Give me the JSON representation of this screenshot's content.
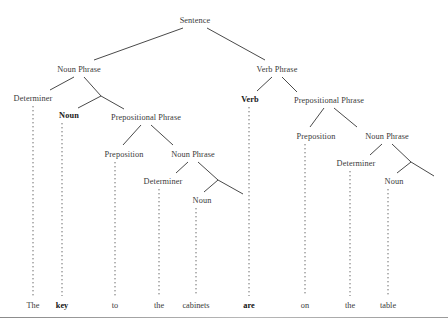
{
  "diagram": {
    "type": "syntax-tree",
    "sentence": "The key to the cabinets are on the table",
    "line_color": "#4a4a4a",
    "text_color": "#3a3a3a",
    "bold_color": "#111111",
    "background": "#ffffff"
  },
  "nodes": [
    {
      "id": "s",
      "label": "Sentence",
      "x": 195,
      "y": 20,
      "bold": false
    },
    {
      "id": "np1",
      "label": "Noun Phrase",
      "x": 79,
      "y": 69,
      "bold": false
    },
    {
      "id": "vp",
      "label": "Verb Phrase",
      "x": 277,
      "y": 69,
      "bold": false
    },
    {
      "id": "det1",
      "label": "Determiner",
      "x": 33,
      "y": 98,
      "bold": false
    },
    {
      "id": "noun1",
      "label": "Noun",
      "x": 69,
      "y": 115,
      "bold": true
    },
    {
      "id": "pp1",
      "label": "Prepositional Phrase",
      "x": 146,
      "y": 117,
      "bold": false
    },
    {
      "id": "verb",
      "label": "Verb",
      "x": 250,
      "y": 99,
      "bold": true
    },
    {
      "id": "pp2",
      "label": "Prepositional Phrase",
      "x": 329,
      "y": 100,
      "bold": false
    },
    {
      "id": "prep1",
      "label": "Preposition",
      "x": 124,
      "y": 154,
      "bold": false
    },
    {
      "id": "np2",
      "label": "Noun Phrase",
      "x": 193,
      "y": 154,
      "bold": false
    },
    {
      "id": "prep2",
      "label": "Preposition",
      "x": 316,
      "y": 136,
      "bold": false
    },
    {
      "id": "np3",
      "label": "Noun Phrase",
      "x": 387,
      "y": 136,
      "bold": false
    },
    {
      "id": "det2",
      "label": "Determiner",
      "x": 163,
      "y": 181,
      "bold": false
    },
    {
      "id": "noun2",
      "label": "Noun",
      "x": 202,
      "y": 200,
      "bold": false
    },
    {
      "id": "det3",
      "label": "Determiner",
      "x": 356,
      "y": 163,
      "bold": false
    },
    {
      "id": "noun3",
      "label": "Noun",
      "x": 394,
      "y": 181,
      "bold": false
    }
  ],
  "words": [
    {
      "id": "w1",
      "text": "The",
      "x": 33,
      "y": 305,
      "bold": false
    },
    {
      "id": "w2",
      "text": "key",
      "x": 62,
      "y": 305,
      "bold": true
    },
    {
      "id": "w3",
      "text": "to",
      "x": 115,
      "y": 305,
      "bold": false
    },
    {
      "id": "w4",
      "text": "the",
      "x": 159,
      "y": 305,
      "bold": false
    },
    {
      "id": "w5",
      "text": "cabinets",
      "x": 196,
      "y": 305,
      "bold": false
    },
    {
      "id": "w6",
      "text": "are",
      "x": 249,
      "y": 305,
      "bold": true
    },
    {
      "id": "w7",
      "text": "on",
      "x": 305,
      "y": 305,
      "bold": false
    },
    {
      "id": "w8",
      "text": "the",
      "x": 350,
      "y": 305,
      "bold": false
    },
    {
      "id": "w9",
      "text": "table",
      "x": 388,
      "y": 305,
      "bold": false
    }
  ],
  "solid_edges": [
    {
      "from": "sentence",
      "to": "noun-phrase-1",
      "x1": 183,
      "y1": 28,
      "x2": 94,
      "y2": 60
    },
    {
      "from": "sentence",
      "to": "verb-phrase",
      "x1": 207,
      "y1": 28,
      "x2": 265,
      "y2": 60
    },
    {
      "from": "noun-phrase-1",
      "to": "determiner-1",
      "x1": 74,
      "y1": 77,
      "x2": 50,
      "y2": 90
    },
    {
      "from": "noun-phrase-1",
      "to": "branch-1",
      "x1": 84,
      "y1": 77,
      "x2": 101,
      "y2": 96
    },
    {
      "from": "branch-1",
      "to": "noun-1",
      "x1": 101,
      "y1": 96,
      "x2": 78,
      "y2": 108
    },
    {
      "from": "branch-1",
      "to": "prepositional-phrase-1",
      "x1": 101,
      "y1": 96,
      "x2": 124,
      "y2": 109
    },
    {
      "from": "verb-phrase",
      "to": "verb",
      "x1": 272,
      "y1": 77,
      "x2": 257,
      "y2": 91
    },
    {
      "from": "verb-phrase",
      "to": "prepositional-phrase-2",
      "x1": 282,
      "y1": 77,
      "x2": 297,
      "y2": 92
    },
    {
      "from": "prep-phrase-1",
      "to": "preposition-1",
      "x1": 141,
      "y1": 125,
      "x2": 123,
      "y2": 145
    },
    {
      "from": "prep-phrase-1",
      "to": "noun-phrase-2",
      "x1": 151,
      "y1": 125,
      "x2": 173,
      "y2": 145
    },
    {
      "from": "prep-phrase-2",
      "to": "preposition-2",
      "x1": 324,
      "y1": 108,
      "x2": 310,
      "y2": 127
    },
    {
      "from": "prep-phrase-2",
      "to": "noun-phrase-3",
      "x1": 334,
      "y1": 108,
      "x2": 357,
      "y2": 127
    },
    {
      "from": "noun-phrase-2",
      "to": "determiner-2",
      "x1": 188,
      "y1": 162,
      "x2": 176,
      "y2": 173
    },
    {
      "from": "noun-phrase-2",
      "to": "branch-2",
      "x1": 198,
      "y1": 162,
      "x2": 218,
      "y2": 180
    },
    {
      "from": "branch-2",
      "to": "noun-2",
      "x1": 218,
      "y1": 180,
      "x2": 204,
      "y2": 192
    },
    {
      "from": "branch-2",
      "to": "dangling-2",
      "x1": 218,
      "y1": 180,
      "x2": 243,
      "y2": 194
    },
    {
      "from": "noun-phrase-3",
      "to": "determiner-3",
      "x1": 382,
      "y1": 144,
      "x2": 370,
      "y2": 155
    },
    {
      "from": "noun-phrase-3",
      "to": "branch-3",
      "x1": 392,
      "y1": 144,
      "x2": 411,
      "y2": 162
    },
    {
      "from": "branch-3",
      "to": "noun-3",
      "x1": 411,
      "y1": 162,
      "x2": 397,
      "y2": 173
    },
    {
      "from": "branch-3",
      "to": "dangling-3",
      "x1": 411,
      "y1": 162,
      "x2": 434,
      "y2": 176
    }
  ],
  "dotted_edges": [
    {
      "from": "determiner-1",
      "to": "word-the-1",
      "x": 33,
      "y1": 106,
      "y2": 296
    },
    {
      "from": "noun-1",
      "to": "word-key",
      "x": 62,
      "y1": 123,
      "y2": 296
    },
    {
      "from": "preposition-1",
      "to": "word-to",
      "x": 115,
      "y1": 162,
      "y2": 296
    },
    {
      "from": "determiner-2",
      "to": "word-the-2",
      "x": 159,
      "y1": 189,
      "y2": 296
    },
    {
      "from": "noun-2",
      "to": "word-cabinets",
      "x": 196,
      "y1": 208,
      "y2": 296
    },
    {
      "from": "verb",
      "to": "word-are",
      "x": 249,
      "y1": 107,
      "y2": 296
    },
    {
      "from": "preposition-2",
      "to": "word-on",
      "x": 305,
      "y1": 144,
      "y2": 296
    },
    {
      "from": "determiner-3",
      "to": "word-the-3",
      "x": 350,
      "y1": 171,
      "y2": 296
    },
    {
      "from": "noun-3",
      "to": "word-table",
      "x": 388,
      "y1": 189,
      "y2": 296
    }
  ]
}
